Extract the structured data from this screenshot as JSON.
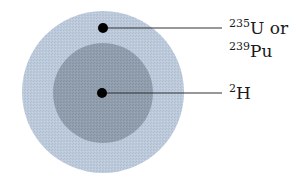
{
  "diagram": {
    "outer_circle": {
      "name": "fissile shell",
      "color": "#b9c8d9",
      "cx": 103,
      "cy": 92,
      "r": 81
    },
    "inner_circle": {
      "name": "fusion core",
      "color": "#8f9cab",
      "cx": 103,
      "cy": 93,
      "r": 50
    },
    "markers": [
      {
        "cx": 103,
        "cy": 28,
        "r": 5,
        "line_to_x": 222
      },
      {
        "cx": 102,
        "cy": 93,
        "r": 5,
        "line_to_x": 222
      }
    ],
    "dot_color": "#000000",
    "line_color": "#333333"
  },
  "labels": {
    "shell": {
      "line1_sup": "235",
      "line1_text": "U or",
      "line2_sup": "239",
      "line2_text": "Pu"
    },
    "core": {
      "sup": "2",
      "text": "H"
    }
  }
}
